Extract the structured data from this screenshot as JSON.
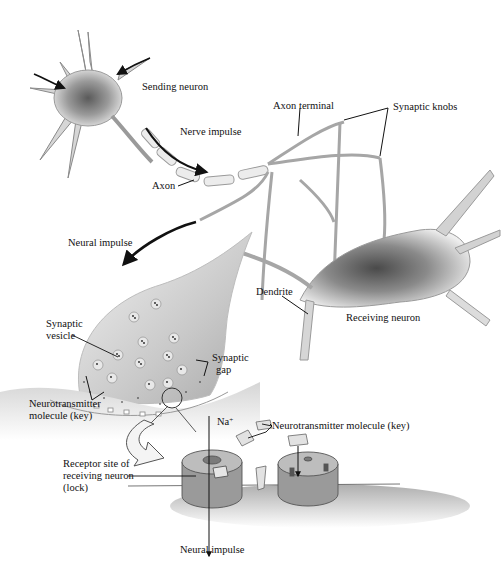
{
  "diagram": {
    "type": "neuron-synapse-illustration",
    "style": "grayscale textbook illustration",
    "labels": {
      "sending_neuron": "Sending neuron",
      "nerve_impulse": "Nerve impulse",
      "axon": "Axon",
      "axon_terminal": "Axon terminal",
      "synaptic_knobs": "Synaptic knobs",
      "neural_impulse_top": "Neural impulse",
      "dendrite": "Dendrite",
      "receiving_neuron": "Receiving neuron",
      "synaptic_vesicle_line1": "Synaptic",
      "synaptic_vesicle_line2": "vesicle",
      "synaptic_gap_line1": "Synaptic",
      "synaptic_gap_line2": "gap",
      "neurotransmitter_left_line1": "Neurotransmitter",
      "neurotransmitter_left_line2": "molecule (key)",
      "sodium_ion": "Na",
      "sodium_charge": "+",
      "neurotransmitter_right": "Neurotransmitter molecule (key)",
      "receptor_line1": "Receptor site of",
      "receptor_line2": "receiving neuron",
      "receptor_line3": "(lock)",
      "neural_impulse_bottom": "Neural impulse"
    },
    "colors": {
      "background": "#ffffff",
      "ink": "#111111",
      "cell_fill": "#d8d8d8",
      "nucleus_shade": "#6a6a6a",
      "receptor_fill": "#9a9a9a",
      "receptor_top": "#b8b8b8"
    }
  }
}
